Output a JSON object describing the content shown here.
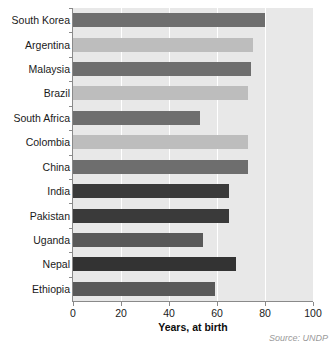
{
  "chart_data": {
    "type": "bar",
    "orientation": "horizontal",
    "title": "",
    "subtitle": "",
    "xlabel": "Years, at birth",
    "ylabel": "",
    "xlim": [
      0,
      100
    ],
    "xticks": [
      0,
      20,
      40,
      60,
      80,
      100
    ],
    "xtick_labels": [
      "0",
      "20",
      "40",
      "60",
      "80",
      "100"
    ],
    "grid": "vertical-white-gridlines",
    "legend": "none",
    "plot_background": "#e8e8e8",
    "categories": [
      "South Korea",
      "Argentina",
      "Malaysia",
      "Brazil",
      "South Africa",
      "Colombia",
      "China",
      "India",
      "Pakistan",
      "Uganda",
      "Nepal",
      "Ethiopia"
    ],
    "values": [
      80,
      75,
      74,
      73,
      53,
      73,
      73,
      65,
      65,
      54,
      68,
      59
    ],
    "bar_colors": [
      "#6e6e6e",
      "#bdbdbd",
      "#6e6e6e",
      "#bdbdbd",
      "#6e6e6e",
      "#bdbdbd",
      "#6e6e6e",
      "#3a3a3a",
      "#3a3a3a",
      "#595959",
      "#333333",
      "#595959"
    ]
  },
  "footer": {
    "source_label": "Source:",
    "source_value": " UNDP"
  }
}
